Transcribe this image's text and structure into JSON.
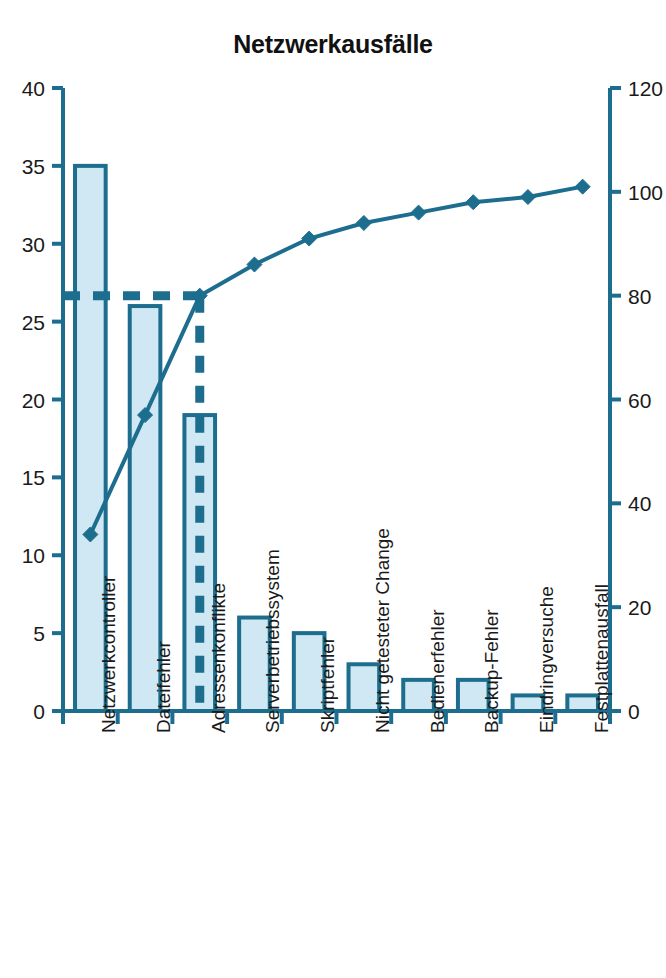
{
  "chart": {
    "title": "Netzwerkausfälle"
  },
  "chart_data": {
    "type": "bar",
    "subtype": "pareto",
    "title": "Netzwerkausfälle",
    "xlabel": "",
    "ylabel": "",
    "categories": [
      "Netzwerkcontroller",
      "Dateifehler",
      "Adressenkonflikte",
      "Serverbetriebssystem",
      "Skriptfehler",
      "Nicht getesteter Change",
      "Bedienerfehler",
      "Backup-Fehler",
      "Eindringversuche",
      "Festplattenausfall"
    ],
    "series": [
      {
        "name": "Anzahl",
        "type": "bar",
        "axis": "left",
        "values": [
          35,
          26,
          19,
          6,
          5,
          3,
          2,
          2,
          1,
          1
        ]
      },
      {
        "name": "Kumulativ %",
        "type": "line",
        "axis": "right",
        "values": [
          34,
          57,
          80,
          86,
          91,
          94,
          96,
          98,
          99,
          101
        ]
      }
    ],
    "left_axis": {
      "min": 0,
      "max": 40,
      "ticks": [
        "0",
        "5",
        "10",
        "15",
        "20",
        "25",
        "30",
        "35",
        "40"
      ],
      "tick_values": [
        0,
        5,
        10,
        15,
        20,
        25,
        30,
        35,
        40
      ]
    },
    "right_axis": {
      "min": 0,
      "max": 120,
      "ticks": [
        "0",
        "20",
        "40",
        "60",
        "80",
        "100",
        "120"
      ],
      "tick_values": [
        0,
        20,
        40,
        60,
        80,
        100,
        120
      ]
    },
    "reference_lines": [
      {
        "name": "80-percent-horizontal",
        "orientation": "horizontal",
        "value": 80,
        "axis": "right",
        "style": "dashed"
      },
      {
        "name": "vital-few-vertical",
        "orientation": "vertical",
        "category_index": 2,
        "style": "dashed"
      }
    ],
    "grid": false,
    "legend": "none",
    "colors": {
      "accent": "#1d6e8e",
      "bar_fill": "#cfe8f3",
      "bar_stroke": "#1d6e8e",
      "line": "#1d6e8e",
      "marker": "#1d6e8e",
      "axis": "#1d6e8e",
      "text": "#1a1a1a",
      "background": "#ffffff"
    }
  }
}
